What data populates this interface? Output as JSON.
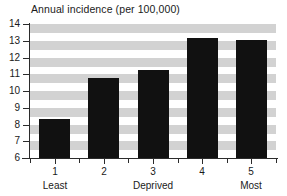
{
  "chart_data": {
    "type": "bar",
    "title": "Annual incidence (per 100,000)",
    "xlabel": "",
    "ylabel": "",
    "categories": [
      "1",
      "2",
      "3",
      "4",
      "5"
    ],
    "values": [
      8.3,
      10.75,
      11.25,
      13.15,
      13.05
    ],
    "ylim": [
      6,
      14
    ],
    "yticks": [
      "6",
      "7",
      "8",
      "9",
      "10",
      "11",
      "12",
      "13",
      "14"
    ],
    "ytick_values": [
      6,
      7,
      8,
      9,
      10,
      11,
      12,
      13,
      14
    ],
    "xtick_labels": [
      "1",
      "2",
      "3",
      "4",
      "5"
    ],
    "group_labels": [
      {
        "text": "Least",
        "category": "1"
      },
      {
        "text": "Deprived",
        "category": "3"
      },
      {
        "text": "Most",
        "category": "5"
      }
    ],
    "grid": "horizontal alternating gray bands",
    "legend": "none",
    "bar_color": "#111111",
    "band_color": "#d2d2d2",
    "background_color": "#ffffff",
    "axis_color": "#2b2b2b"
  }
}
